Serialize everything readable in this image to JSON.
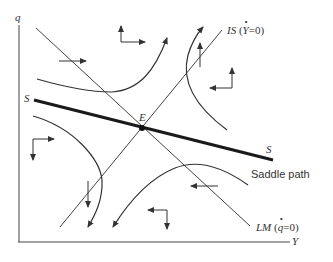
{
  "diagram": {
    "type": "phase-diagram",
    "axes": {
      "x_label": "Y",
      "y_label": "q"
    },
    "lines": {
      "is": {
        "name": "IS",
        "condition": "(Ẏ = 0)",
        "prefix": "IS",
        "cond_open": "(",
        "cond_var": "Y",
        "cond_rest": "=0)"
      },
      "lm": {
        "name": "LM",
        "condition": "(q̇ = 0)",
        "prefix": "LM",
        "cond_open": "(",
        "cond_var": "q",
        "cond_rest": "=0)"
      },
      "saddle": {
        "label_left": "S",
        "label_right": "S",
        "caption": "Saddle path"
      }
    },
    "equilibrium": {
      "label": "E"
    },
    "colors": {
      "ink": "#333333",
      "saddle": "#1a1a1a",
      "background": "#ffffff"
    }
  }
}
